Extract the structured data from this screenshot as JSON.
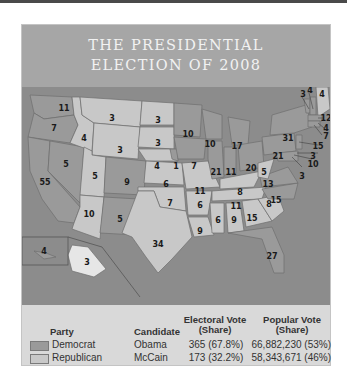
{
  "title": {
    "line1": "THE PRESIDENTIAL",
    "line2": "ELECTION OF 2008"
  },
  "colors": {
    "democrat": "#9a9a9a",
    "republican": "#c8c8c8",
    "water": "#8c8c8c",
    "header": "#a6a6a6",
    "panel": "#d9d9d9"
  },
  "map": {
    "states": [
      {
        "abbr": "WA",
        "votes": "11",
        "party": "D"
      },
      {
        "abbr": "OR",
        "votes": "7",
        "party": "D"
      },
      {
        "abbr": "CA",
        "votes": "55",
        "party": "D"
      },
      {
        "abbr": "NV",
        "votes": "5",
        "party": "D"
      },
      {
        "abbr": "ID",
        "votes": "4",
        "party": "R"
      },
      {
        "abbr": "MT",
        "votes": "3",
        "party": "R"
      },
      {
        "abbr": "WY",
        "votes": "3",
        "party": "R"
      },
      {
        "abbr": "UT",
        "votes": "5",
        "party": "R"
      },
      {
        "abbr": "AZ",
        "votes": "10",
        "party": "R"
      },
      {
        "abbr": "CO",
        "votes": "9",
        "party": "D"
      },
      {
        "abbr": "NM",
        "votes": "5",
        "party": "D"
      },
      {
        "abbr": "ND",
        "votes": "3",
        "party": "R"
      },
      {
        "abbr": "SD",
        "votes": "3",
        "party": "R"
      },
      {
        "abbr": "NE",
        "votes": "4",
        "party": "R"
      },
      {
        "abbr": "NE-2",
        "votes": "1",
        "party": "D"
      },
      {
        "abbr": "KS",
        "votes": "6",
        "party": "R"
      },
      {
        "abbr": "OK",
        "votes": "7",
        "party": "R"
      },
      {
        "abbr": "TX",
        "votes": "34",
        "party": "R"
      },
      {
        "abbr": "MN",
        "votes": "10",
        "party": "D"
      },
      {
        "abbr": "IA",
        "votes": "7",
        "party": "D"
      },
      {
        "abbr": "MO",
        "votes": "11",
        "party": "R"
      },
      {
        "abbr": "AR",
        "votes": "6",
        "party": "R"
      },
      {
        "abbr": "LA",
        "votes": "9",
        "party": "R"
      },
      {
        "abbr": "WI",
        "votes": "10",
        "party": "D"
      },
      {
        "abbr": "IL",
        "votes": "21",
        "party": "D"
      },
      {
        "abbr": "MI",
        "votes": "17",
        "party": "D"
      },
      {
        "abbr": "IN",
        "votes": "11",
        "party": "D"
      },
      {
        "abbr": "OH",
        "votes": "20",
        "party": "D"
      },
      {
        "abbr": "KY",
        "votes": "8",
        "party": "R"
      },
      {
        "abbr": "TN",
        "votes": "11",
        "party": "R"
      },
      {
        "abbr": "MS",
        "votes": "6",
        "party": "R"
      },
      {
        "abbr": "AL",
        "votes": "9",
        "party": "R"
      },
      {
        "abbr": "GA",
        "votes": "15",
        "party": "R"
      },
      {
        "abbr": "FL",
        "votes": "27",
        "party": "D"
      },
      {
        "abbr": "SC",
        "votes": "8",
        "party": "R"
      },
      {
        "abbr": "NC",
        "votes": "15",
        "party": "D"
      },
      {
        "abbr": "VA",
        "votes": "13",
        "party": "D"
      },
      {
        "abbr": "WV",
        "votes": "5",
        "party": "R"
      },
      {
        "abbr": "PA",
        "votes": "21",
        "party": "D"
      },
      {
        "abbr": "NY",
        "votes": "31",
        "party": "D"
      },
      {
        "abbr": "VT",
        "votes": "3",
        "party": "D"
      },
      {
        "abbr": "NH",
        "votes": "4",
        "party": "D"
      },
      {
        "abbr": "ME",
        "votes": "4",
        "party": "D"
      },
      {
        "abbr": "MA",
        "votes": "12",
        "party": "D"
      },
      {
        "abbr": "RI",
        "votes": "4",
        "party": "D"
      },
      {
        "abbr": "CT",
        "votes": "7",
        "party": "D"
      },
      {
        "abbr": "NJ",
        "votes": "15",
        "party": "D"
      },
      {
        "abbr": "DE",
        "votes": "3",
        "party": "D"
      },
      {
        "abbr": "MD",
        "votes": "10",
        "party": "D"
      },
      {
        "abbr": "DC",
        "votes": "3",
        "party": "D"
      },
      {
        "abbr": "AK",
        "votes": "3",
        "party": "R"
      },
      {
        "abbr": "HI",
        "votes": "4",
        "party": "D"
      }
    ]
  },
  "legend": {
    "headers": {
      "party": "Party",
      "candidate": "Candidate",
      "electoral_line1": "Electoral Vote",
      "electoral_line2": "(Share)",
      "popular_line1": "Popular Vote",
      "popular_line2": "(Share)"
    },
    "rows": [
      {
        "party": "Democrat",
        "candidate": "Obama",
        "electoral": "365 (67.8%)",
        "popular": "66,882,230 (53%)"
      },
      {
        "party": "Republican",
        "candidate": "McCain",
        "electoral": "173 (32.2%)",
        "popular": "58,343,671 (46%)"
      }
    ]
  }
}
